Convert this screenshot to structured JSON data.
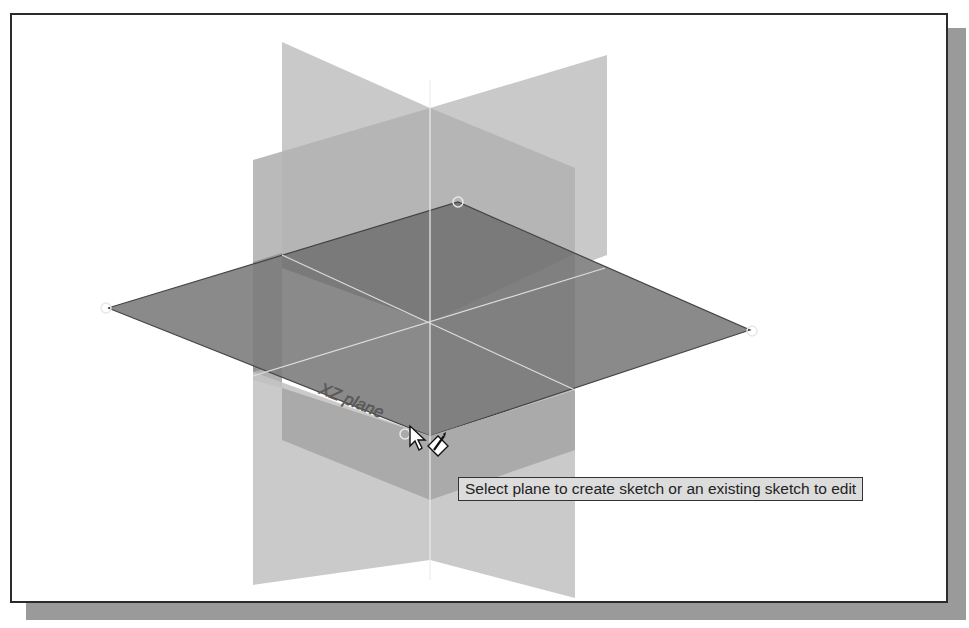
{
  "viewport": {
    "name": "3D modeling graphics area",
    "background": "#ffffff",
    "frame_border": "#2b2b2b",
    "shadow_color": "#9a9a9a"
  },
  "planes": {
    "xz_plane_label": "XZ plane",
    "light_plane_color": "#c8c8c8",
    "mid_plane_color": "#a8a8a8",
    "dark_plane_color": "#7d7d7d",
    "axis_color": "#e6e6e6"
  },
  "tooltip": {
    "text": "Select plane to create sketch or an existing sketch to edit"
  },
  "cursor": {
    "icon": "arrow-with-sketch-pencil-icon"
  }
}
